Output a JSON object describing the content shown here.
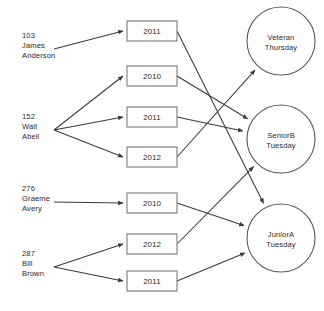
{
  "diagram": {
    "type": "entity-relationship-mapping",
    "background_color": "#ffffff",
    "line_color": "#3a3a3a",
    "box_stroke_color": "#7a7a7a",
    "circle_stroke_color": "#5a5a5a",
    "text_color": "#2b2b2b"
  },
  "persons": [
    {
      "id": "103",
      "first_name": "James",
      "last_name": "Anderson",
      "x": 22,
      "y": 38
    },
    {
      "id": "152",
      "first_name": "Walt",
      "last_name": "Abell",
      "x": 22,
      "y": 119
    },
    {
      "id": "276",
      "first_name": "Graeme",
      "last_name": "Avery",
      "x": 22,
      "y": 191
    },
    {
      "id": "287",
      "first_name": "Bill",
      "last_name": "Brown",
      "x": 22,
      "y": 256
    }
  ],
  "years": [
    {
      "key": "y1",
      "label": "2011",
      "cx": 152,
      "cy": 31
    },
    {
      "key": "y2",
      "label": "2010",
      "cx": 152,
      "cy": 76
    },
    {
      "key": "y3",
      "label": "2011",
      "cx": 152,
      "cy": 117
    },
    {
      "key": "y4",
      "label": "2012",
      "cx": 152,
      "cy": 157
    },
    {
      "key": "y5",
      "label": "2010",
      "cx": 152,
      "cy": 203
    },
    {
      "key": "y6",
      "label": "2012",
      "cx": 152,
      "cy": 244
    },
    {
      "key": "y7",
      "label": "2011",
      "cx": 152,
      "cy": 281
    }
  ],
  "classes": [
    {
      "key": "c1",
      "name": "Veteran",
      "day": "Thursday",
      "cx": 281,
      "cy": 41
    },
    {
      "key": "c2",
      "name": "SeniorB",
      "day": "Tuesday",
      "cx": 281,
      "cy": 139
    },
    {
      "key": "c3",
      "name": "JuniorA",
      "day": "Tuesday",
      "cx": 281,
      "cy": 238
    }
  ],
  "person_to_year_links": [
    {
      "from": "103",
      "to": "y1"
    },
    {
      "from": "152",
      "to": "y2"
    },
    {
      "from": "152",
      "to": "y3"
    },
    {
      "from": "152",
      "to": "y4"
    },
    {
      "from": "276",
      "to": "y5"
    },
    {
      "from": "287",
      "to": "y6"
    },
    {
      "from": "287",
      "to": "y7"
    }
  ],
  "year_to_class_links": [
    {
      "from": "y1",
      "to": "c3"
    },
    {
      "from": "y2",
      "to": "c2"
    },
    {
      "from": "y3",
      "to": "c2"
    },
    {
      "from": "y4",
      "to": "c1"
    },
    {
      "from": "y5",
      "to": "c3"
    },
    {
      "from": "y6",
      "to": "c2"
    },
    {
      "from": "y7",
      "to": "c3"
    }
  ]
}
